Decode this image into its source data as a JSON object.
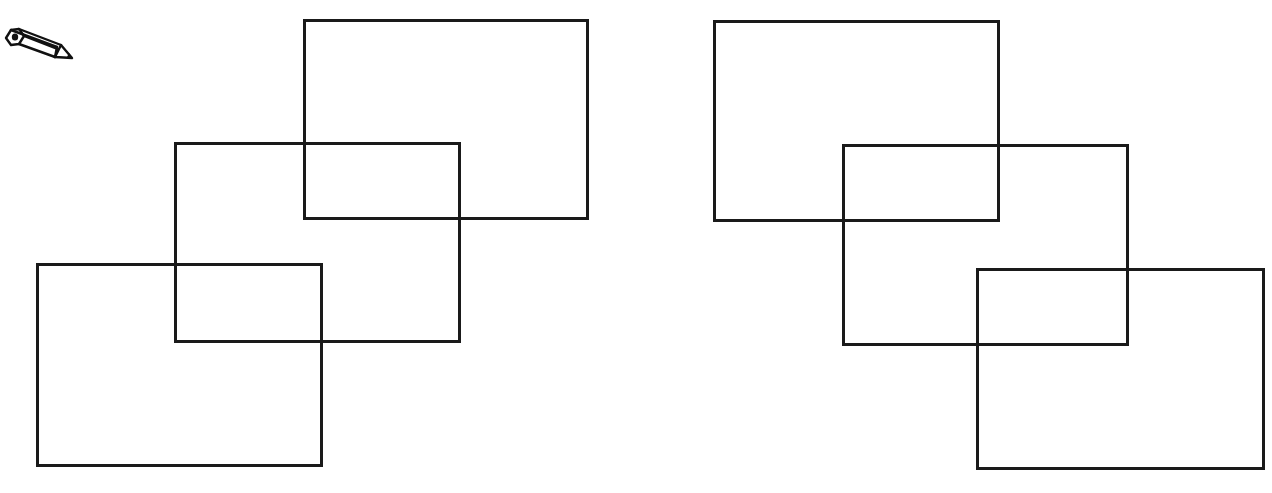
{
  "figure": {
    "description": "Two groups of three overlapping outlined rectangles arranged diagonally, with a pencil icon in the top-left corner",
    "stroke_color": "#1a1a1a",
    "background_color": "#ffffff",
    "icon": {
      "name": "pencil-icon",
      "glyph": "✏"
    },
    "groups": [
      {
        "name": "left-group",
        "orientation": "descending-left",
        "rectangles": [
          {
            "id": "L1",
            "x": 303,
            "y": 19,
            "w": 286,
            "h": 201
          },
          {
            "id": "L2",
            "x": 174,
            "y": 142,
            "w": 287,
            "h": 201
          },
          {
            "id": "L3",
            "x": 36,
            "y": 263,
            "w": 287,
            "h": 204
          }
        ]
      },
      {
        "name": "right-group",
        "orientation": "descending-right",
        "rectangles": [
          {
            "id": "R1",
            "x": 713,
            "y": 20,
            "w": 287,
            "h": 202
          },
          {
            "id": "R2",
            "x": 842,
            "y": 144,
            "w": 287,
            "h": 202
          },
          {
            "id": "R3",
            "x": 976,
            "y": 268,
            "w": 289,
            "h": 202
          }
        ]
      }
    ]
  }
}
